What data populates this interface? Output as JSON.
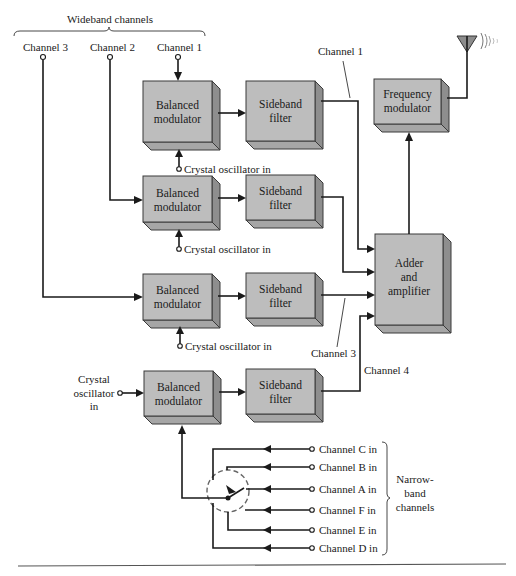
{
  "diagram": {
    "groups": {
      "wideband": "Wideband channels",
      "narrowband": [
        "Narrow-",
        "band",
        "channels"
      ]
    },
    "inputs": {
      "channel_3": "Channel 3",
      "channel_2": "Channel 2",
      "channel_1": "Channel 1",
      "crystal_oscillator_in": "Crystal oscillator in",
      "crystal_left": [
        "Crystal",
        "oscillator",
        "in"
      ]
    },
    "blocks": {
      "balanced_modulator": [
        "Balanced",
        "modulator"
      ],
      "sideband_filter": [
        "Sideband",
        "filter"
      ],
      "frequency_modulator": [
        "Frequency",
        "modulator"
      ],
      "adder_amplifier": [
        "Adder",
        "and",
        "amplifier"
      ]
    },
    "line_labels": {
      "channel_1": "Channel 1",
      "channel_3": "Channel 3",
      "channel_4": "Channel 4"
    },
    "narrowband_inputs": [
      "Channel C in",
      "Channel B in",
      "Channel A in",
      "Channel F in",
      "Channel E in",
      "Channel D in"
    ]
  }
}
